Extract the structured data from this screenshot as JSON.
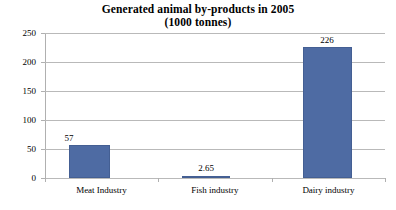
{
  "chart_data": {
    "type": "bar",
    "title": "Generated animal by-products in 2005",
    "subtitle": "(1000 tonnes)",
    "xlabel": "",
    "ylabel": "",
    "categories": [
      "Meat Industry",
      "Fish industry",
      "Dairy industry"
    ],
    "values": [
      57,
      2.65,
      226
    ],
    "value_labels": [
      "57",
      "2.65",
      "226"
    ],
    "ylim": [
      0,
      250
    ],
    "yticks": [
      0,
      50,
      100,
      150,
      200,
      250
    ],
    "ytick_labels": [
      "0",
      "50",
      "100",
      "150",
      "200",
      "250"
    ],
    "grid": true,
    "grid_axis": "y",
    "legend": false,
    "colors": {
      "bar_fill": "#4e6ba3",
      "bar_border": "#445f93",
      "gridline": "#b9b9b9",
      "axis": "#b0b0b0",
      "text": "#000000",
      "background": "#ffffff"
    }
  }
}
